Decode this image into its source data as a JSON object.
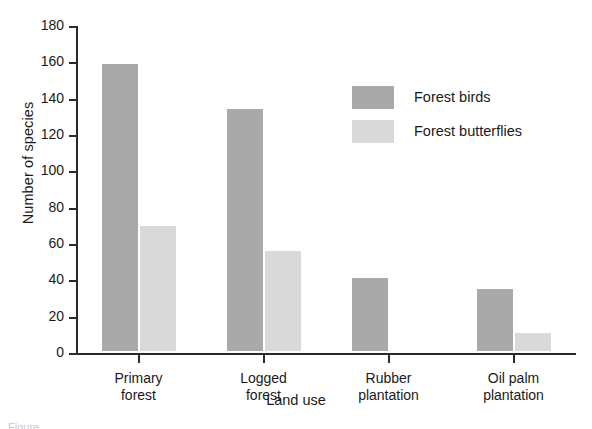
{
  "chart_data": {
    "type": "bar",
    "title": "",
    "xlabel": "Land use",
    "ylabel": "Number of species",
    "categories": [
      "Primary\nforest",
      "Logged\nforest",
      "Rubber\nplantation",
      "Oil palm\nplantation"
    ],
    "ylim": [
      0,
      180
    ],
    "ytick_labels": [
      "0",
      "20",
      "40",
      "60",
      "80",
      "100",
      "120",
      "140",
      "160",
      "180"
    ],
    "ytick_values": [
      0,
      20,
      40,
      60,
      80,
      100,
      120,
      140,
      160,
      180
    ],
    "grid": false,
    "legend_position": "upper center-right",
    "series": [
      {
        "name": "Forest birds",
        "color": "#a9a9a9",
        "values": [
          158,
          133,
          40,
          34
        ]
      },
      {
        "name": "Forest butterflies",
        "color": "#d9d9d9",
        "values": [
          69,
          55,
          0,
          10
        ]
      }
    ]
  },
  "legend": {
    "items": [
      {
        "label": "Forest birds",
        "color": "#a9a9a9"
      },
      {
        "label": "Forest butterflies",
        "color": "#d9d9d9"
      }
    ]
  },
  "caption": {
    "text": "Figure"
  }
}
